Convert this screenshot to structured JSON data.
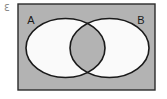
{
  "figure": {
    "type": "venn-diagram",
    "width": 167,
    "height": 99
  },
  "colors": {
    "page_background": "#ffffff",
    "universe_fill": "#b3b3b3",
    "universe_stroke": "#2b2b2b",
    "circle_fill": "#fafafa",
    "circle_stroke": "#1a1a1a",
    "intersection_fill": "#b3b3b3",
    "label_color": "#1a1a1a",
    "corner_mark_color": "#8a8a8a"
  },
  "universe": {
    "name": "universal-set-rectangle",
    "x": 18,
    "y": 4,
    "width": 137,
    "height": 86,
    "stroke_width": 1.4
  },
  "sets": [
    {
      "id": "A",
      "label": "A",
      "label_x": 31,
      "label_y": 24,
      "ellipse": {
        "cx": 65.5,
        "cy": 48,
        "rx": 39.5,
        "ry": 29.5
      }
    },
    {
      "id": "B",
      "label": "B",
      "label_x": 141,
      "label_y": 24,
      "ellipse": {
        "cx": 109.5,
        "cy": 48,
        "rx": 39.5,
        "ry": 29.5
      }
    }
  ],
  "intersection": {
    "name": "intersection-region",
    "label": ""
  },
  "corner_mark": {
    "text": "ℇ",
    "x": 4,
    "y": 11
  },
  "stroke_widths": {
    "ellipse": 1.6,
    "rectangle": 1.4
  }
}
